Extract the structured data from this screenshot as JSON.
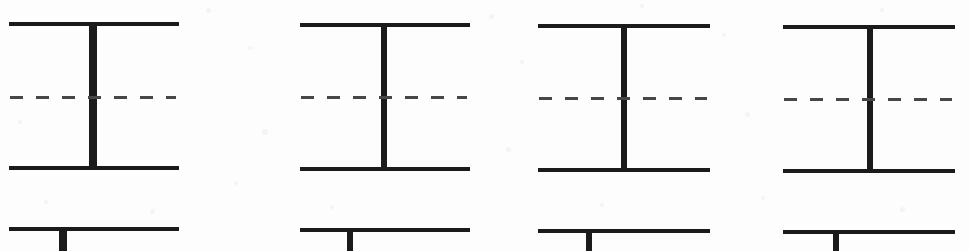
{
  "figure": {
    "type": "diagram",
    "background_color": "#fdfdfd",
    "ink_color": "#1b1b1b",
    "dash_color": "#474747",
    "canvas": {
      "width": 970,
      "height": 251
    },
    "panels": [
      {
        "name": "panel-1",
        "top_flange": {
          "x": 9,
          "y": 22,
          "width": 170,
          "height": 4
        },
        "bottom_flange": {
          "x": 9,
          "y": 166,
          "width": 170,
          "height": 4
        },
        "stem": {
          "x": 89,
          "y": 22,
          "width": 8,
          "height": 148
        },
        "centerline": {
          "x": 10,
          "y": 96,
          "width": 166,
          "thickness": 3,
          "dash": "13px 13px"
        },
        "partial": {
          "flange": {
            "x": 9,
            "y": 227,
            "width": 170,
            "height": 4
          },
          "stem": {
            "x": 59,
            "y": 229,
            "width": 8,
            "height": 22
          }
        }
      },
      {
        "name": "panel-2",
        "top_flange": {
          "x": 300,
          "y": 23,
          "width": 170,
          "height": 4
        },
        "bottom_flange": {
          "x": 300,
          "y": 167,
          "width": 170,
          "height": 4
        },
        "stem": {
          "x": 381,
          "y": 23,
          "width": 6,
          "height": 148
        },
        "centerline": {
          "x": 301,
          "y": 96,
          "width": 166,
          "thickness": 3,
          "dash": "13px 13px"
        },
        "partial": {
          "flange": {
            "x": 300,
            "y": 228,
            "width": 170,
            "height": 4
          },
          "stem": {
            "x": 347,
            "y": 230,
            "width": 6,
            "height": 21
          }
        }
      },
      {
        "name": "panel-3",
        "top_flange": {
          "x": 538,
          "y": 24,
          "width": 172,
          "height": 4
        },
        "bottom_flange": {
          "x": 538,
          "y": 168,
          "width": 172,
          "height": 4
        },
        "stem": {
          "x": 621,
          "y": 24,
          "width": 6,
          "height": 148
        },
        "centerline": {
          "x": 539,
          "y": 97,
          "width": 168,
          "thickness": 3,
          "dash": "13px 13px"
        },
        "partial": {
          "flange": {
            "x": 538,
            "y": 229,
            "width": 172,
            "height": 4
          },
          "stem": {
            "x": 586,
            "y": 231,
            "width": 6,
            "height": 20
          }
        }
      },
      {
        "name": "panel-4",
        "top_flange": {
          "x": 783,
          "y": 25,
          "width": 172,
          "height": 4
        },
        "bottom_flange": {
          "x": 783,
          "y": 169,
          "width": 172,
          "height": 4
        },
        "stem": {
          "x": 867,
          "y": 25,
          "width": 6,
          "height": 148
        },
        "centerline": {
          "x": 784,
          "y": 98,
          "width": 168,
          "thickness": 3,
          "dash": "13px 13px"
        },
        "partial": {
          "flange": {
            "x": 783,
            "y": 230,
            "width": 172,
            "height": 4
          },
          "stem": {
            "x": 833,
            "y": 232,
            "width": 6,
            "height": 19
          }
        }
      }
    ],
    "scan_specks": [
      {
        "x": 206,
        "y": 8,
        "size": 5
      },
      {
        "x": 248,
        "y": 46,
        "size": 4
      },
      {
        "x": 262,
        "y": 129,
        "size": 6
      },
      {
        "x": 234,
        "y": 181,
        "size": 4
      },
      {
        "x": 489,
        "y": 14,
        "size": 5
      },
      {
        "x": 520,
        "y": 60,
        "size": 4
      },
      {
        "x": 506,
        "y": 147,
        "size": 5
      },
      {
        "x": 722,
        "y": 33,
        "size": 4
      },
      {
        "x": 745,
        "y": 112,
        "size": 5
      },
      {
        "x": 761,
        "y": 196,
        "size": 4
      },
      {
        "x": 44,
        "y": 200,
        "size": 4
      },
      {
        "x": 150,
        "y": 209,
        "size": 5
      },
      {
        "x": 330,
        "y": 205,
        "size": 4
      },
      {
        "x": 600,
        "y": 203,
        "size": 4
      },
      {
        "x": 900,
        "y": 207,
        "size": 5
      },
      {
        "x": 18,
        "y": 120,
        "size": 4
      },
      {
        "x": 640,
        "y": 4,
        "size": 4
      },
      {
        "x": 880,
        "y": 8,
        "size": 4
      }
    ]
  }
}
